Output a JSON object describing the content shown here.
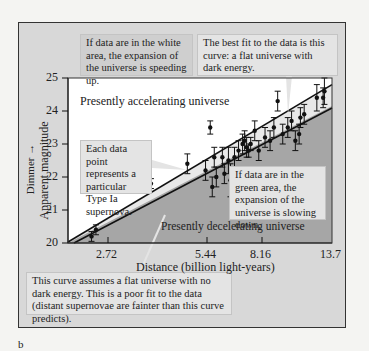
{
  "panel_label": "b",
  "colors": {
    "frame_bg": "#d8d8d8",
    "accelerating_region": "#ffffff",
    "decelerating_region": "#a6a6a6",
    "callout_bg": "#e4e4e4",
    "line": "#111111"
  },
  "callouts": {
    "white_area": "If data are in the white area, the expansion of the universe is speeding up.",
    "best_fit": "The best fit to the data is this curve: a flat universe with dark energy.",
    "data_point": "Each data point represents a particular Type Ia supernova.",
    "green_area": "If data are in the green area, the expansion of the universe is slowing down.",
    "no_dark_energy": "This curve assumes a flat universe with no dark energy. This is a poor fit to the data (distant supernovae are fainter than this curve predicts)."
  },
  "chart_data": {
    "type": "scatter",
    "title": "",
    "xlabel": "Distance (billion light-years)",
    "ylabel": "Apparent magnitude",
    "ylabel_annotation": "Dimmer →",
    "x_ticks": [
      2.72,
      5.44,
      8.16,
      13.7
    ],
    "y_ticks": [
      20,
      21,
      22,
      23,
      24,
      25
    ],
    "ylim": [
      20,
      25
    ],
    "grid": false,
    "region_labels": [
      "Presently accelerating universe",
      "Presently decelerating universe"
    ],
    "series": [
      {
        "name": "Best fit: flat universe with dark energy",
        "type": "line",
        "x": [
          0,
          13.7
        ],
        "y": [
          19.9,
          24.8
        ]
      },
      {
        "name": "Flat universe with no dark energy",
        "type": "line",
        "x": [
          0,
          13.7
        ],
        "y": [
          19.8,
          24.3
        ]
      },
      {
        "name": "Type Ia supernovae",
        "type": "scatter_errorbar",
        "points": [
          {
            "x": 1.6,
            "y": 20.2,
            "err": 0.15
          },
          {
            "x": 1.9,
            "y": 20.4,
            "err": 0.15
          },
          {
            "x": 3.9,
            "y": 21.8,
            "err": 0.15
          },
          {
            "x": 4.9,
            "y": 22.4,
            "err": 0.3
          },
          {
            "x": 5.4,
            "y": 22.2,
            "err": 0.3
          },
          {
            "x": 5.6,
            "y": 23.5,
            "err": 0.2
          },
          {
            "x": 5.7,
            "y": 21.7,
            "err": 0.3
          },
          {
            "x": 5.8,
            "y": 22.6,
            "err": 0.3
          },
          {
            "x": 5.9,
            "y": 22.0,
            "err": 0.3
          },
          {
            "x": 6.2,
            "y": 22.6,
            "err": 0.3
          },
          {
            "x": 6.3,
            "y": 22.1,
            "err": 0.3
          },
          {
            "x": 6.5,
            "y": 22.5,
            "err": 0.4
          },
          {
            "x": 6.6,
            "y": 21.9,
            "err": 0.5
          },
          {
            "x": 6.8,
            "y": 22.6,
            "err": 0.3
          },
          {
            "x": 7.0,
            "y": 22.8,
            "err": 0.3
          },
          {
            "x": 7.2,
            "y": 23.0,
            "err": 0.3
          },
          {
            "x": 7.3,
            "y": 23.1,
            "err": 0.3
          },
          {
            "x": 7.4,
            "y": 22.9,
            "err": 0.3
          },
          {
            "x": 7.5,
            "y": 22.8,
            "err": 0.2
          },
          {
            "x": 7.6,
            "y": 23.0,
            "err": 0.2
          },
          {
            "x": 7.8,
            "y": 23.4,
            "err": 0.3
          },
          {
            "x": 8.0,
            "y": 22.8,
            "err": 0.3
          },
          {
            "x": 8.4,
            "y": 23.2,
            "err": 0.3
          },
          {
            "x": 8.8,
            "y": 23.1,
            "err": 0.3
          },
          {
            "x": 9.1,
            "y": 23.5,
            "err": 0.3
          },
          {
            "x": 9.4,
            "y": 24.3,
            "err": 0.3
          },
          {
            "x": 9.8,
            "y": 23.3,
            "err": 0.3
          },
          {
            "x": 10.2,
            "y": 23.5,
            "err": 0.3
          },
          {
            "x": 10.5,
            "y": 23.7,
            "err": 0.3
          },
          {
            "x": 10.8,
            "y": 23.1,
            "err": 0.3
          },
          {
            "x": 11.1,
            "y": 23.3,
            "err": 0.3
          },
          {
            "x": 11.2,
            "y": 23.8,
            "err": 0.3
          },
          {
            "x": 11.5,
            "y": 23.9,
            "err": 0.3
          },
          {
            "x": 12.5,
            "y": 24.4,
            "err": 0.4
          },
          {
            "x": 13.0,
            "y": 24.4,
            "err": 0.3
          },
          {
            "x": 13.1,
            "y": 24.6,
            "err": 0.4
          }
        ]
      }
    ]
  }
}
